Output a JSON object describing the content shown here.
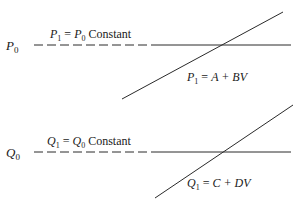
{
  "panels": [
    {
      "id": "top",
      "axis_label": {
        "var": "P",
        "sub": "0"
      },
      "constant_label": {
        "lhs_var": "P",
        "lhs_sub": "1",
        "eq": " = ",
        "rhs_var": "P",
        "rhs_sub": "0",
        "suffix": " Constant"
      },
      "line_label": {
        "lhs_var": "P",
        "lhs_sub": "1",
        "eq": " = ",
        "rhs": "A + BV"
      }
    },
    {
      "id": "bottom",
      "axis_label": {
        "var": "Q",
        "sub": "0"
      },
      "constant_label": {
        "lhs_var": "Q",
        "lhs_sub": "1",
        "eq": " = ",
        "rhs_var": "Q",
        "rhs_sub": "0",
        "suffix": " Constant"
      },
      "line_label": {
        "lhs_var": "Q",
        "lhs_sub": "1",
        "eq": " = ",
        "rhs": "C + DV"
      }
    }
  ],
  "colors": {
    "line": "#2a2a2a",
    "text": "#1a1a1a",
    "background": "#ffffff"
  }
}
